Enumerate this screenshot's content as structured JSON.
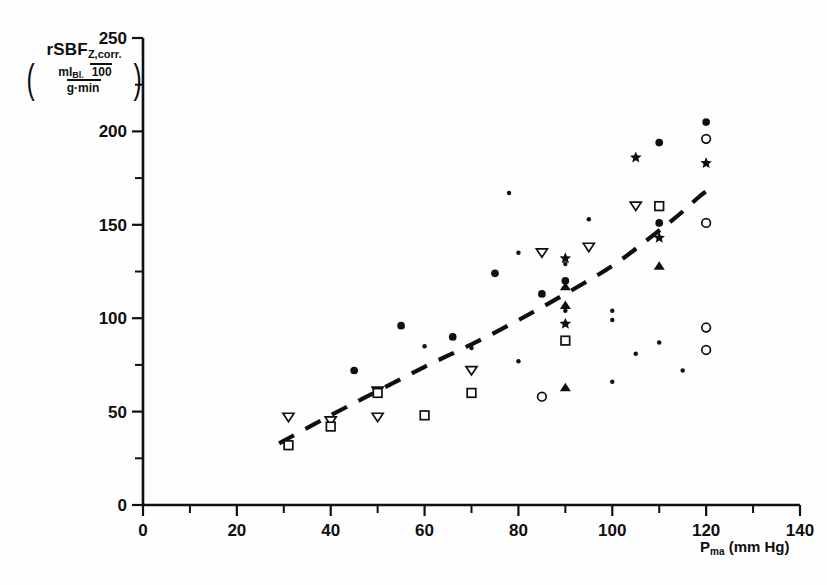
{
  "figure": {
    "background": "#fefefe",
    "ink": "#100f0f"
  },
  "axes": {
    "y_label_main": "rSBF",
    "y_label_sub": "Z,corr.",
    "y_units_numerator": "ml",
    "y_units_numerator_sub": "Bl.",
    "y_units_denominator": "100 g·min",
    "x_label_main": "P",
    "x_label_sub": "ma",
    "x_label_units": "(mm Hg)",
    "x_ticks": [
      "0",
      "20",
      "40",
      "60",
      "80",
      "100",
      "120",
      "140"
    ],
    "y_ticks": [
      "0",
      "50",
      "100",
      "150",
      "200",
      "250"
    ]
  },
  "chart_data": {
    "type": "scatter",
    "title": "",
    "xlabel": "P_ma (mm Hg)",
    "ylabel": "rSBF_Z,corr. (ml_Bl / 100 g·min)",
    "xlim": [
      0,
      140
    ],
    "ylim": [
      0,
      250
    ],
    "x_major_step": 20,
    "x_minor_step": 10,
    "y_major_step": 50,
    "y_minor_step": 25,
    "grid": false,
    "legend": "none",
    "series": [
      {
        "name": "filled-circle-large",
        "marker": "filled-circle",
        "size": 6.2,
        "points": [
          [
            45,
            72
          ],
          [
            55,
            96
          ],
          [
            66,
            90
          ],
          [
            75,
            124
          ],
          [
            85,
            113
          ],
          [
            90,
            120
          ],
          [
            110,
            194
          ],
          [
            110,
            151
          ],
          [
            120,
            205
          ]
        ]
      },
      {
        "name": "filled-circle-small",
        "marker": "filled-circle",
        "size": 3.6,
        "points": [
          [
            50,
            61
          ],
          [
            60,
            85
          ],
          [
            70,
            84
          ],
          [
            78,
            167
          ],
          [
            80,
            135
          ],
          [
            80,
            77
          ],
          [
            90,
            129
          ],
          [
            90,
            104
          ],
          [
            95,
            153
          ],
          [
            100,
            104
          ],
          [
            100,
            99
          ],
          [
            100,
            66
          ],
          [
            105,
            81
          ],
          [
            110,
            87
          ],
          [
            115,
            72
          ]
        ]
      },
      {
        "name": "open-triangle-down",
        "marker": "open-triangle-down",
        "size": 6.0,
        "points": [
          [
            31,
            47
          ],
          [
            40,
            45
          ],
          [
            50,
            47
          ],
          [
            50,
            61
          ],
          [
            70,
            72
          ],
          [
            85,
            135
          ],
          [
            95,
            138
          ],
          [
            105,
            160
          ]
        ]
      },
      {
        "name": "open-square",
        "marker": "open-square",
        "size": 6.0,
        "points": [
          [
            31,
            32
          ],
          [
            40,
            42
          ],
          [
            50,
            60
          ],
          [
            60,
            48
          ],
          [
            70,
            60
          ],
          [
            90,
            88
          ],
          [
            110,
            160
          ]
        ]
      },
      {
        "name": "star",
        "marker": "star",
        "size": 6.4,
        "points": [
          [
            90,
            97
          ],
          [
            90,
            132
          ],
          [
            105,
            186
          ],
          [
            110,
            143
          ],
          [
            120,
            183
          ]
        ]
      },
      {
        "name": "filled-triangle-up",
        "marker": "filled-triangle-up",
        "size": 6.0,
        "points": [
          [
            90,
            63
          ],
          [
            90,
            107
          ],
          [
            90,
            117
          ],
          [
            110,
            128
          ]
        ]
      },
      {
        "name": "open-circle",
        "marker": "open-circle",
        "size": 6.0,
        "points": [
          [
            85,
            58
          ],
          [
            120,
            196
          ],
          [
            120,
            151
          ],
          [
            120,
            95
          ],
          [
            120,
            83
          ]
        ]
      }
    ],
    "trend_line": {
      "style": "dashed",
      "name": "regression-curve",
      "points": [
        [
          29,
          33
        ],
        [
          40,
          48
        ],
        [
          50,
          61
        ],
        [
          60,
          74
        ],
        [
          70,
          86
        ],
        [
          80,
          99
        ],
        [
          90,
          113
        ],
        [
          100,
          128
        ],
        [
          108,
          143
        ],
        [
          114,
          155
        ],
        [
          119,
          166
        ],
        [
          122,
          171
        ]
      ]
    }
  }
}
